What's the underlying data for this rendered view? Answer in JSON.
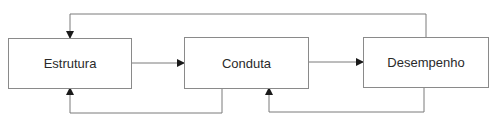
{
  "diagram": {
    "type": "flowchart",
    "nodes": [
      {
        "id": "estrutura",
        "label": "Estrutura"
      },
      {
        "id": "conduta",
        "label": "Conduta"
      },
      {
        "id": "desempenho",
        "label": "Desempenho"
      }
    ],
    "edges": [
      {
        "from": "estrutura",
        "to": "conduta",
        "kind": "forward"
      },
      {
        "from": "conduta",
        "to": "desempenho",
        "kind": "forward"
      },
      {
        "from": "desempenho",
        "to": "estrutura",
        "kind": "feedback-top"
      },
      {
        "from": "conduta",
        "to": "estrutura",
        "kind": "feedback-bottom"
      },
      {
        "from": "desempenho",
        "to": "conduta",
        "kind": "feedback-bottom"
      }
    ],
    "colors": {
      "line": "#7a7a7a",
      "arrowhead": "#1a1a1a",
      "border": "#8a8a8a",
      "text": "#2a2a2a"
    }
  }
}
